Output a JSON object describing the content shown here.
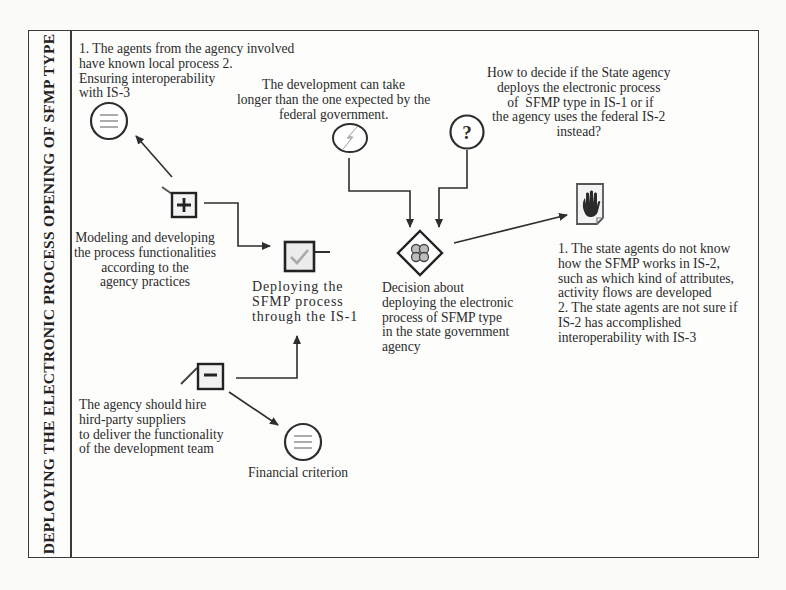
{
  "lane": {
    "label": "DEPLOYING THE ELECTRONIC PROCESS OPENING OF SFMP TYPE"
  },
  "nodes": {
    "interop_note": {
      "text": "1. The agents from the agency involved\nhave known local process 2.\nEnsuring interoperability\nwith IS-3",
      "icon": "list-circle-icon"
    },
    "delay_note": {
      "text": "The development can take\nlonger than the one expected by the\nfederal government.",
      "icon": "lightning-circle-icon"
    },
    "question_note": {
      "text": "How to decide if the State agency\ndeploys the electronic process\n of  SFMP type in IS-1 or if\nthe agency uses the federal IS-2\ninstead?",
      "icon": "question-circle-icon",
      "glyph": "?"
    },
    "modeling": {
      "text": "Modeling and developing\nthe process functionalities\naccording to the\nagency practices",
      "icon": "plus-box-icon"
    },
    "deploying": {
      "text": "Deploying the\nSFMP process\nthrough the IS-1",
      "icon": "checkmark-box-icon"
    },
    "decision": {
      "text": "Decision about\ndeploying the electronic\nprocess of SFMP type\nin the state government\nagency",
      "icon": "decision-diamond-icon"
    },
    "risk_note": {
      "text": "1. The state agents do not know\nhow the SFMP works in IS-2,\nsuch as which kind of attributes,\nactivity flows are developed\n2. The state agents are not sure if\nIS-2 has accomplished\ninteroperability with IS-3",
      "icon": "stop-hand-document-icon"
    },
    "hire": {
      "text": "The agency should hire\nhird-party suppliers\nto deliver the functionality\nof the development team",
      "icon": "minus-box-icon"
    },
    "financial": {
      "text": "Financial criterion",
      "icon": "list-circle-icon"
    }
  },
  "colors": {
    "line": "#2e2e2e",
    "frame": "#3a3a3a",
    "background": "#fbfbfa"
  }
}
